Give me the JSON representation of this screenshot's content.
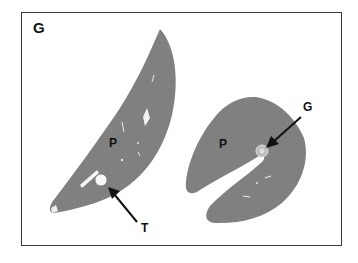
{
  "figure": {
    "panel_label": "G",
    "labels": {
      "left_parenchyma": "P",
      "right_parenchyma": "P",
      "granuloma": "G",
      "tumor": "T"
    },
    "colors": {
      "tissue": "#808080",
      "border": "#3a3a3a",
      "background": "#ffffff",
      "arrow": "#111111"
    }
  }
}
